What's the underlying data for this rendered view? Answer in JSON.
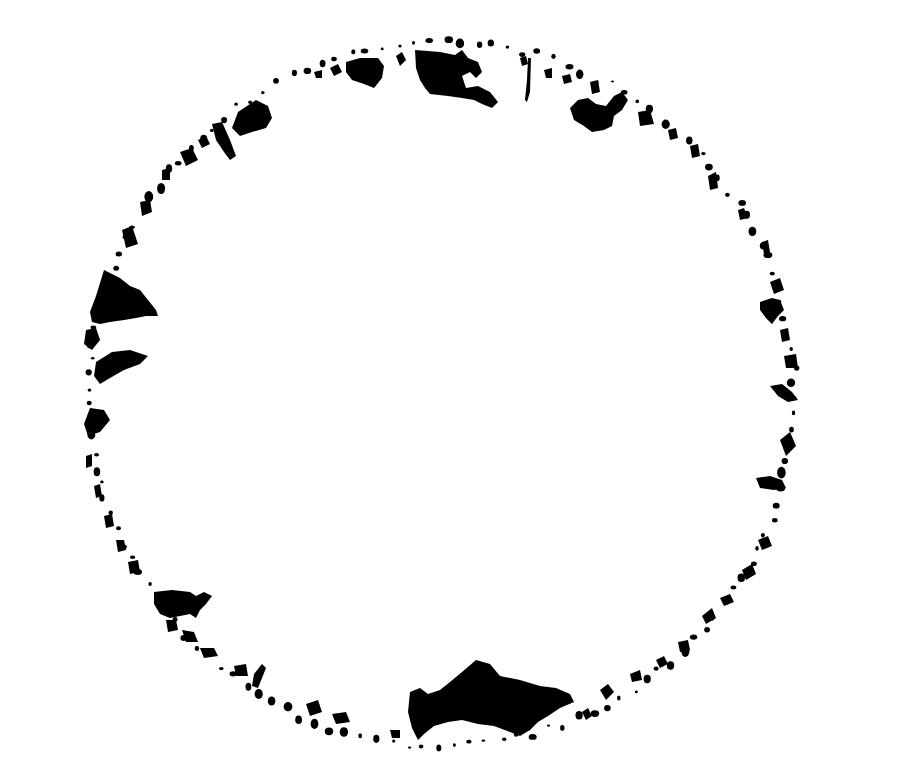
{
  "artwork": {
    "description": "Country silhouettes arranged around a circular ring on white background",
    "colors": {
      "background": "#ffffff",
      "silhouette": "#000000"
    },
    "ring": {
      "cx": 442,
      "cy": 394,
      "r": 352
    },
    "major_shapes": [
      {
        "name": "canada",
        "position": "top"
      },
      {
        "name": "china",
        "position": "upper-right"
      },
      {
        "name": "india",
        "position": "right"
      },
      {
        "name": "mexico",
        "position": "right"
      },
      {
        "name": "greenland",
        "position": "left"
      },
      {
        "name": "antarctica",
        "position": "left"
      },
      {
        "name": "usa",
        "position": "lower-left"
      },
      {
        "name": "russia",
        "position": "bottom"
      }
    ]
  }
}
